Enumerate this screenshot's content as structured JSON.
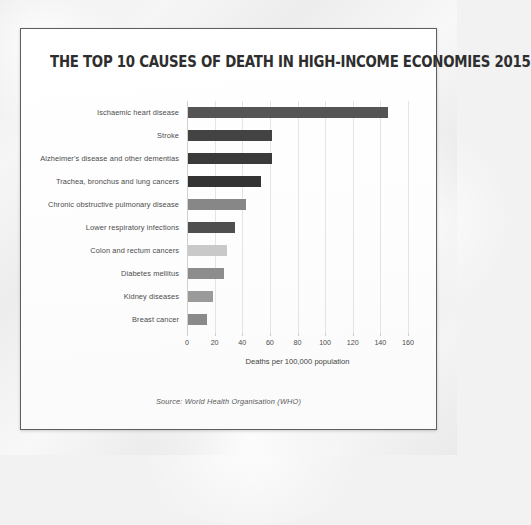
{
  "card": {
    "title": "THE TOP 10 CAUSES OF DEATH IN HIGH-INCOME ECONOMIES 2015",
    "source": "Source: World Health Organisation (WHO)"
  },
  "chart_data": {
    "type": "bar",
    "orientation": "horizontal",
    "title": "THE TOP 10 CAUSES OF DEATH IN HIGH-INCOME ECONOMIES 2015",
    "xlabel": "Deaths per 100,000 population",
    "ylabel": "",
    "xlim": [
      0,
      160
    ],
    "xticks": [
      0,
      20,
      40,
      60,
      80,
      100,
      120,
      140,
      160
    ],
    "grid": true,
    "legend": false,
    "categories": [
      "Ischaemic heart disease",
      "Stroke",
      "Alzheimer's disease and other dementias",
      "Trachea, bronchus and lung cancers",
      "Chronic obstructive pulmonary disease",
      "Lower respiratory infections",
      "Colon and rectum cancers",
      "Diabetes mellitus",
      "Kidney diseases",
      "Breast cancer"
    ],
    "values": [
      145,
      61,
      61,
      53,
      42,
      34,
      28,
      26,
      18,
      14
    ],
    "bar_colors": [
      "#555555",
      "#434343",
      "#3a3a3a",
      "#333333",
      "#878787",
      "#4f4f4f",
      "#c9c9c9",
      "#8d8d8d",
      "#9a9a9a",
      "#8a8a8a"
    ]
  }
}
